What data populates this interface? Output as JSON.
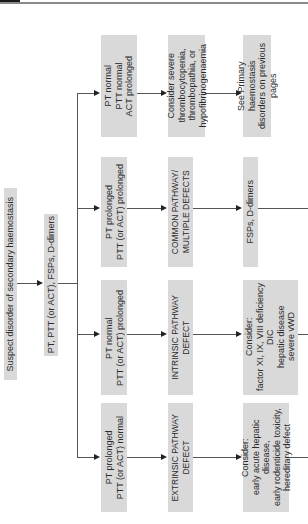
{
  "header": {
    "tab_color": "#1a1a1a",
    "rule_color": "#8a8a8a"
  },
  "flowchart": {
    "orientation": "rotated 90° counter-clockwise (reads bottom-to-top)",
    "box_color": "#d9d9d9",
    "start": {
      "label": "Suspect disorder of secondary haemostasis"
    },
    "tests": {
      "label": "PT, PTT (or ACT), FSPs, D-dimers"
    },
    "branches": [
      {
        "result": "PT normal\nPTT normal\nACT prolonged",
        "category": "Consider severe\nthrombocytopenia,\nthrombopathia, or\nhypofibrinogenaemia",
        "next": "See Primary haemostasis\ndisorders on previous pages"
      },
      {
        "result": "PT prolonged\nPTT (or ACT) prolonged",
        "category": "COMMON PATHWAY/\nMULTIPLE DEFECTS",
        "next": "FSPs, D-dimers"
      },
      {
        "result": "PT normal\nPTT (or ACT) prolonged",
        "category": "INTRINSIC PATHWAY\nDEFECT",
        "next": "Consider:\nfactor XI, IX, VIII deficiency\nDIC\nhepatic disease\nsevere vWD"
      },
      {
        "result": "PT prolonged\nPTT (or ACT) normal",
        "category": "EXTRINSIC PATHWAY\nDEFECT",
        "next": "Consider:\nearly acute hepatic disease,\nearly rodenticide toxicity,\nhereditary defect"
      }
    ]
  }
}
